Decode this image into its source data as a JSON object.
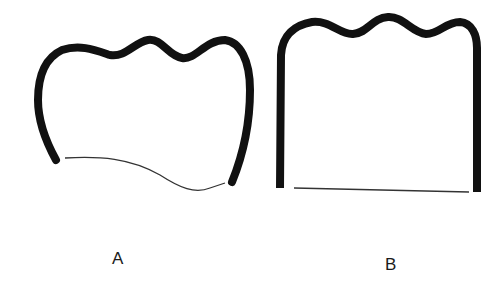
{
  "figure": {
    "panels": [
      {
        "id": "A",
        "label": "A",
        "description": "Curved outline with thick wavy top and thin bottom line"
      },
      {
        "id": "B",
        "label": "B",
        "description": "Rectangular outline with thick wavy top, straight vertical sides and thin bottom line"
      }
    ],
    "colors": {
      "stroke": "#111111",
      "background": "#ffffff"
    }
  }
}
